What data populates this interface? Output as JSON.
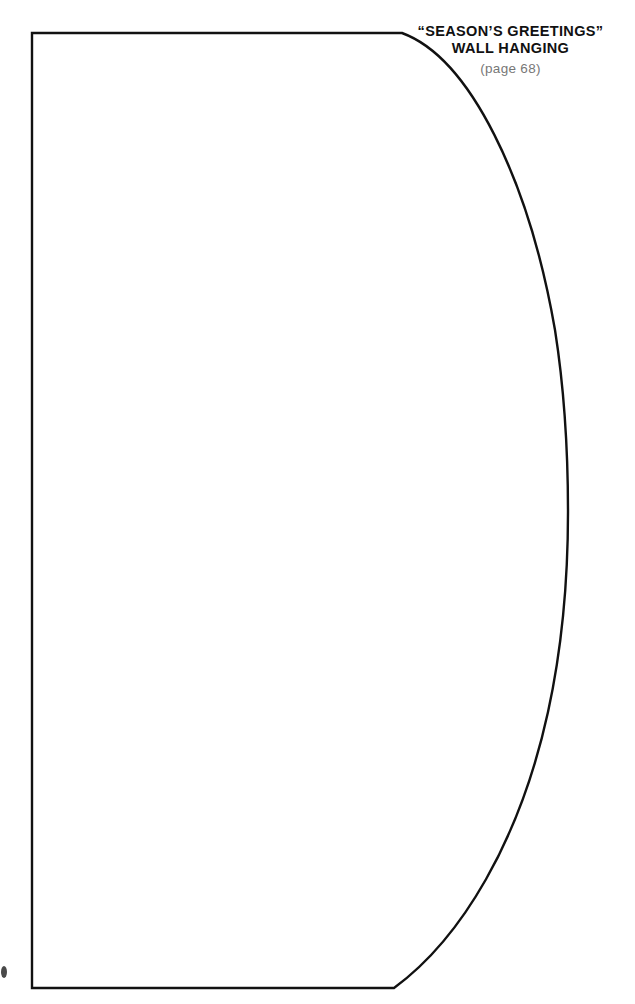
{
  "page": {
    "background_color": "#ffffff",
    "width": 635,
    "height": 1004,
    "kind": "craft-pattern-template-page"
  },
  "title_block": {
    "line1": "“SEASON’S GREETINGS”",
    "line2": "WALL HANGING",
    "page_ref": "(page 68)",
    "title_color": "#111111",
    "page_ref_color": "#777777"
  },
  "pattern_shape": {
    "name": "wall-hanging-panel-outline",
    "stroke_color": "#111111",
    "fill_color": "#ffffff",
    "stroke_width": 2.4,
    "description": "Half-oval / D-shaped cutting template with straight left edge, straight top and bottom edges, and a bulging curved right side",
    "geometry": {
      "left_edge_x": 32,
      "top_edge_y": 33,
      "bottom_edge_y": 988,
      "top_corner_x": 402,
      "bottom_corner_x": 394,
      "rightmost_x": 568,
      "rightmost_y": 512
    }
  },
  "artifacts": {
    "scan_speck_label": "scan-speck"
  }
}
